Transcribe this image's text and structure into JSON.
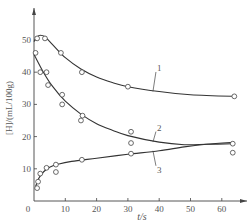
{
  "chart_data": {
    "type": "line",
    "title": "",
    "xlabel": "t/s",
    "ylabel": "[H]/(mL/100g)",
    "xlim": [
      0,
      66
    ],
    "ylim": [
      0,
      55
    ],
    "x_ticks": [
      0,
      10,
      20,
      30,
      40,
      50,
      60
    ],
    "y_ticks": [
      10,
      20,
      30,
      40,
      50
    ],
    "x_tick_labels": [
      "0",
      "10",
      "20",
      "30",
      "40",
      "50",
      "60"
    ],
    "y_tick_labels": [
      "10",
      "20",
      "30",
      "40",
      "50"
    ],
    "origin_label": "0",
    "grid": false,
    "legend": "inline curve labels",
    "series": [
      {
        "name": "1",
        "points": [
          [
            1,
            50.5
          ],
          [
            3.5,
            50.5
          ],
          [
            8.6,
            46
          ],
          [
            15.3,
            40
          ],
          [
            30,
            35.5
          ],
          [
            64,
            32.5
          ]
        ],
        "curve": [
          [
            0,
            49.5
          ],
          [
            1,
            51
          ],
          [
            2,
            51.5
          ],
          [
            3.5,
            51
          ],
          [
            6,
            48.5
          ],
          [
            10,
            44.5
          ],
          [
            15,
            41
          ],
          [
            20,
            38.5
          ],
          [
            25,
            36.8
          ],
          [
            30,
            35.5
          ],
          [
            40,
            34
          ],
          [
            50,
            33
          ],
          [
            64,
            32.5
          ]
        ],
        "label_pos": [
          38,
          41
        ]
      },
      {
        "name": "2",
        "points": [
          [
            0.5,
            46
          ],
          [
            2,
            40
          ],
          [
            4,
            40
          ],
          [
            4.5,
            36
          ],
          [
            9,
            33
          ],
          [
            9,
            30
          ],
          [
            15.5,
            26.5
          ],
          [
            15,
            25
          ],
          [
            31,
            21.5
          ],
          [
            31,
            18
          ],
          [
            63.5,
            17.8
          ]
        ],
        "curve": [
          [
            0,
            45.5
          ],
          [
            3,
            40
          ],
          [
            6,
            35.5
          ],
          [
            10,
            31
          ],
          [
            15,
            27
          ],
          [
            20,
            24
          ],
          [
            25,
            22
          ],
          [
            30,
            20.3
          ],
          [
            40,
            18.3
          ],
          [
            48,
            17.5
          ],
          [
            55,
            17.6
          ],
          [
            63.5,
            17.8
          ]
        ],
        "label_pos": [
          38,
          22.5
        ]
      },
      {
        "name": "3",
        "points": [
          [
            1,
            4
          ],
          [
            1.3,
            6
          ],
          [
            2,
            8.5
          ],
          [
            4,
            10.3
          ],
          [
            7,
            11.3
          ],
          [
            7,
            9
          ],
          [
            15.3,
            12.8
          ],
          [
            31,
            14.7
          ],
          [
            63.5,
            15
          ]
        ],
        "curve": [
          [
            0.5,
            4.5
          ],
          [
            1.5,
            7
          ],
          [
            3,
            9
          ],
          [
            5,
            10.5
          ],
          [
            8,
            11.5
          ],
          [
            12,
            12.3
          ],
          [
            20,
            13.3
          ],
          [
            30,
            14.5
          ],
          [
            40,
            15.6
          ],
          [
            48,
            16.8
          ],
          [
            55,
            17.6
          ],
          [
            63.5,
            18.2
          ]
        ],
        "label_pos": [
          38,
          10
        ]
      }
    ]
  },
  "axis": {
    "x_label": "t/s",
    "y_label": "[H]/(mL/100g)"
  }
}
